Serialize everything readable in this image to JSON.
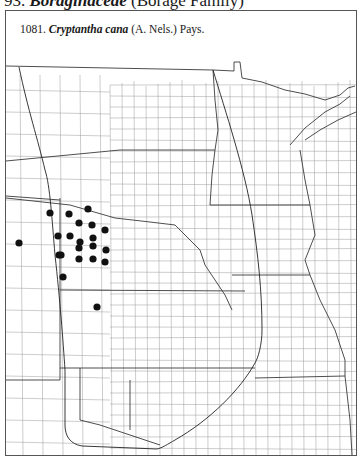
{
  "heading": {
    "number": "93.",
    "family": "Boraginaceae",
    "common": "(Borage Family)"
  },
  "map": {
    "label_number": "1081.",
    "species": "Cryptantha cana",
    "authority": "(A. Nels.) Pays.",
    "dot_color": "#111111",
    "line_color": "#888888",
    "border_color": "#333333",
    "dots": [
      {
        "x": 50,
        "y": 213
      },
      {
        "x": 69,
        "y": 214
      },
      {
        "x": 88,
        "y": 209
      },
      {
        "x": 79,
        "y": 223
      },
      {
        "x": 92,
        "y": 225
      },
      {
        "x": 105,
        "y": 230
      },
      {
        "x": 58,
        "y": 236
      },
      {
        "x": 70,
        "y": 236
      },
      {
        "x": 80,
        "y": 242
      },
      {
        "x": 79,
        "y": 248
      },
      {
        "x": 93,
        "y": 238
      },
      {
        "x": 93,
        "y": 246
      },
      {
        "x": 106,
        "y": 250
      },
      {
        "x": 59,
        "y": 255
      },
      {
        "x": 61,
        "y": 255
      },
      {
        "x": 79,
        "y": 259
      },
      {
        "x": 93,
        "y": 259
      },
      {
        "x": 105,
        "y": 262
      },
      {
        "x": 19,
        "y": 243
      },
      {
        "x": 63,
        "y": 277
      },
      {
        "x": 97,
        "y": 307
      }
    ]
  }
}
